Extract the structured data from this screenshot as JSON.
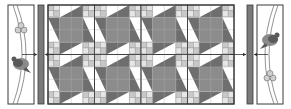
{
  "diagram": {
    "type": "quilt-layout",
    "colors": {
      "background": "#ffffff",
      "outline": "#3a3a3a",
      "dark_triangle": "#6e6e6e",
      "mid_square": "#8c8c8c",
      "four_patch_light": "#c8c8c8",
      "four_patch_lighter": "#e6e6e6",
      "sashing": "#7a7a7a",
      "applique_dark": "#5a5a5a",
      "applique_mid": "#8a8a8a",
      "applique_light": "#cfcfcf"
    },
    "center_panel": {
      "block_columns": 4,
      "block_rows": 2,
      "block_motif": "pinwheel-star-with-four-patch"
    },
    "sashing_strips": [
      {
        "side": "left"
      },
      {
        "side": "right"
      }
    ],
    "border_panels": [
      {
        "side": "left",
        "motif": "bird-and-berries-vine",
        "bird_position": "bottom",
        "berries_position": "top"
      },
      {
        "side": "right",
        "motif": "bird-and-berries-vine",
        "bird_position": "top",
        "berries_position": "bottom"
      }
    ],
    "arrows": [
      {
        "from": "left-border",
        "to": "left-sashing",
        "direction": "right"
      },
      {
        "from": "center-panel",
        "to": "left-sashing",
        "direction": "left"
      },
      {
        "from": "center-panel",
        "to": "right-sashing",
        "direction": "right"
      },
      {
        "from": "right-border",
        "to": "right-sashing",
        "direction": "left"
      }
    ]
  }
}
